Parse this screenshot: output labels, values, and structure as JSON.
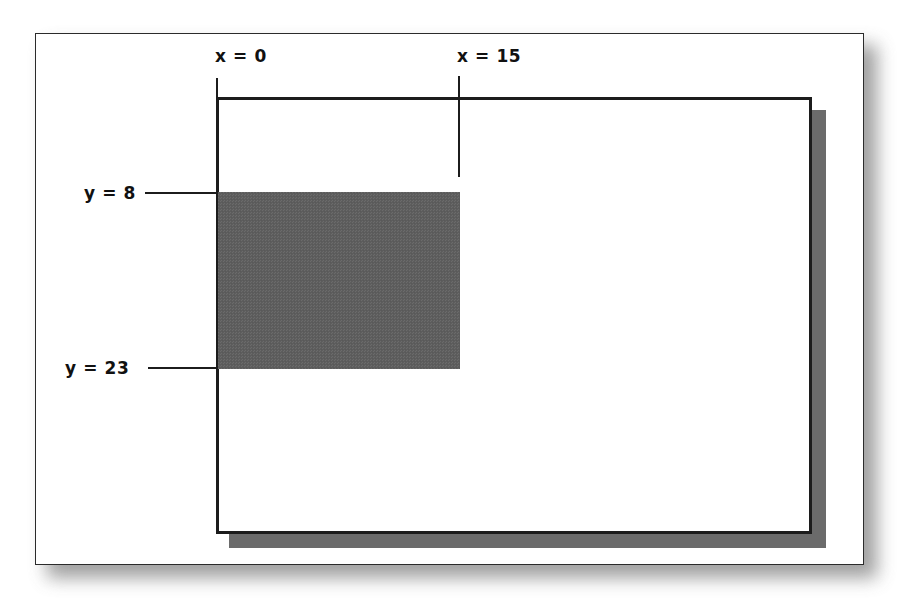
{
  "diagram": {
    "background_color": "#ffffff",
    "labels": {
      "x_start": "x = 0",
      "x_end": "x = 15",
      "y_start": "y = 8",
      "y_end": "y = 23"
    },
    "colors": {
      "line": "#1c1c1c",
      "frame_border": "#2b2b2b",
      "shaded_fill": "#5e5e5e",
      "inner_shadow": "#6b6b6b",
      "outer_shadow": "#8f8f8f",
      "text": "#111111"
    },
    "coordinates": {
      "x_start_value": 0,
      "x_end_value": 15,
      "y_start_value": 8,
      "y_end_value": 23,
      "width_units": 15,
      "height_units": 15
    },
    "elements": {
      "outer_frame_name": "outer page frame",
      "inner_rect_name": "drawing canvas rectangle",
      "shaded_rect_name": "shaded coordinate region"
    }
  }
}
